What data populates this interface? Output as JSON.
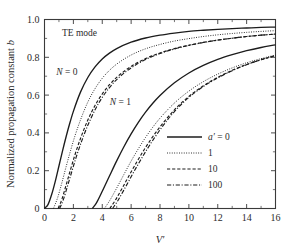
{
  "chart_data": {
    "type": "line",
    "title": "",
    "annotation_mode": "TE mode",
    "xlabel": "V'",
    "ylabel": "Normalized propagation constant b",
    "xlim": [
      0,
      16
    ],
    "ylim": [
      0,
      1.0
    ],
    "xticks": [
      0,
      2,
      4,
      6,
      8,
      10,
      12,
      14,
      16
    ],
    "xtick_labels": [
      "0",
      "2",
      "4",
      "6",
      "8",
      "10",
      "12",
      "14",
      "16"
    ],
    "yticks": [
      0,
      0.2,
      0.4,
      0.6,
      0.8,
      1.0
    ],
    "ytick_labels": [
      "0",
      "0.2",
      "0.4",
      "0.6",
      "0.8",
      "1.0"
    ],
    "x_minor_step": 1,
    "y_minor_step": 0.1,
    "grid": false,
    "legend_position": "lower right",
    "legend_title_symbol": "a'",
    "mode_labels": [
      {
        "text": "N = 0",
        "x": 1.55,
        "y": 0.705
      },
      {
        "text": "N = 1",
        "x": 5.25,
        "y": 0.545
      }
    ],
    "series": [
      {
        "name": "a' = 0",
        "legend_label": "a′ = 0",
        "style": "solid",
        "mode": "N=0",
        "cutoff": 0.0,
        "x": [
          0.0,
          0.25,
          0.5,
          0.75,
          1.0,
          1.25,
          1.5,
          1.75,
          2.0,
          2.5,
          3.0,
          3.5,
          4.0,
          4.5,
          5.0,
          6.0,
          7.0,
          8.0,
          9.0,
          10.0,
          11.0,
          12.0,
          13.0,
          14.0,
          15.0,
          16.0
        ],
        "y": [
          0.0,
          0.022,
          0.075,
          0.145,
          0.225,
          0.305,
          0.381,
          0.451,
          0.514,
          0.617,
          0.693,
          0.749,
          0.791,
          0.822,
          0.846,
          0.88,
          0.902,
          0.917,
          0.928,
          0.937,
          0.943,
          0.948,
          0.952,
          0.955,
          0.958,
          0.96
        ]
      },
      {
        "name": "a' = 1",
        "legend_label": "1",
        "style": "dotted",
        "mode": "N=0",
        "cutoff": 0.62,
        "x": [
          0.62,
          0.9,
          1.2,
          1.5,
          1.8,
          2.1,
          2.5,
          3.0,
          3.5,
          4.0,
          4.5,
          5.0,
          6.0,
          7.0,
          8.0,
          9.0,
          10.0,
          11.0,
          12.0,
          13.0,
          14.0,
          15.0,
          16.0
        ],
        "y": [
          0.0,
          0.055,
          0.135,
          0.222,
          0.305,
          0.382,
          0.47,
          0.563,
          0.634,
          0.689,
          0.731,
          0.764,
          0.812,
          0.845,
          0.868,
          0.886,
          0.899,
          0.91,
          0.919,
          0.926,
          0.932,
          0.937,
          0.941
        ]
      },
      {
        "name": "a' = 10",
        "legend_label": "10",
        "style": "dashed",
        "mode": "N=0",
        "cutoff": 0.95,
        "x": [
          0.95,
          1.2,
          1.5,
          1.8,
          2.1,
          2.5,
          3.0,
          3.5,
          4.0,
          4.5,
          5.0,
          6.0,
          7.0,
          8.0,
          9.0,
          10.0,
          11.0,
          12.0,
          13.0,
          14.0,
          15.0,
          16.0
        ],
        "y": [
          0.0,
          0.048,
          0.125,
          0.205,
          0.282,
          0.372,
          0.468,
          0.545,
          0.606,
          0.655,
          0.694,
          0.752,
          0.793,
          0.823,
          0.846,
          0.864,
          0.879,
          0.891,
          0.901,
          0.91,
          0.917,
          0.923
        ]
      },
      {
        "name": "a' = 100",
        "legend_label": "100",
        "style": "dashdot",
        "mode": "N=0",
        "cutoff": 1.05,
        "x": [
          1.05,
          1.3,
          1.6,
          1.9,
          2.2,
          2.6,
          3.0,
          3.5,
          4.0,
          4.5,
          5.0,
          6.0,
          7.0,
          8.0,
          9.0,
          10.0,
          11.0,
          12.0,
          13.0,
          14.0,
          15.0,
          16.0
        ],
        "y": [
          0.0,
          0.046,
          0.12,
          0.198,
          0.273,
          0.362,
          0.44,
          0.522,
          0.588,
          0.64,
          0.682,
          0.744,
          0.788,
          0.82,
          0.844,
          0.863,
          0.878,
          0.891,
          0.901,
          0.91,
          0.917,
          0.923
        ]
      },
      {
        "name": "a' = 0",
        "legend_label": "a′ = 0",
        "style": "solid",
        "mode": "N=1",
        "cutoff": 3.32,
        "x": [
          3.32,
          3.6,
          4.0,
          4.5,
          5.0,
          5.5,
          6.0,
          6.5,
          7.0,
          7.5,
          8.0,
          9.0,
          10.0,
          11.0,
          12.0,
          13.0,
          14.0,
          15.0,
          16.0
        ],
        "y": [
          0.0,
          0.03,
          0.091,
          0.172,
          0.252,
          0.327,
          0.395,
          0.456,
          0.51,
          0.557,
          0.598,
          0.665,
          0.717,
          0.757,
          0.789,
          0.814,
          0.835,
          0.852,
          0.866
        ]
      },
      {
        "name": "a' = 1",
        "legend_label": "1",
        "style": "dotted",
        "mode": "N=1",
        "cutoff": 4.15,
        "x": [
          4.15,
          4.5,
          5.0,
          5.5,
          6.0,
          6.5,
          7.0,
          7.5,
          8.0,
          9.0,
          10.0,
          11.0,
          12.0,
          13.0,
          14.0,
          15.0,
          16.0
        ],
        "y": [
          0.0,
          0.04,
          0.108,
          0.18,
          0.251,
          0.316,
          0.376,
          0.43,
          0.478,
          0.558,
          0.621,
          0.671,
          0.711,
          0.744,
          0.771,
          0.793,
          0.812
        ]
      },
      {
        "name": "a' = 10",
        "legend_label": "10",
        "style": "dashed",
        "mode": "N=1",
        "cutoff": 4.52,
        "x": [
          4.52,
          4.9,
          5.4,
          5.9,
          6.4,
          6.9,
          7.4,
          8.0,
          9.0,
          10.0,
          11.0,
          12.0,
          13.0,
          14.0,
          15.0,
          16.0
        ],
        "y": [
          0.0,
          0.043,
          0.11,
          0.18,
          0.247,
          0.311,
          0.369,
          0.432,
          0.522,
          0.593,
          0.649,
          0.694,
          0.731,
          0.762,
          0.787,
          0.809
        ]
      },
      {
        "name": "a' = 100",
        "legend_label": "100",
        "style": "dashdot",
        "mode": "N=1",
        "cutoff": 4.72,
        "x": [
          4.72,
          5.1,
          5.6,
          6.1,
          6.6,
          7.1,
          7.6,
          8.2,
          9.0,
          10.0,
          11.0,
          12.0,
          13.0,
          14.0,
          15.0,
          16.0
        ],
        "y": [
          0.0,
          0.044,
          0.112,
          0.182,
          0.249,
          0.313,
          0.372,
          0.437,
          0.513,
          0.588,
          0.645,
          0.691,
          0.729,
          0.761,
          0.787,
          0.809
        ]
      }
    ],
    "legend_entries": [
      {
        "label": "a′ = 0",
        "style": "solid"
      },
      {
        "label": "1",
        "style": "dotted"
      },
      {
        "label": "10",
        "style": "dashed"
      },
      {
        "label": "100",
        "style": "dashdot"
      }
    ]
  }
}
